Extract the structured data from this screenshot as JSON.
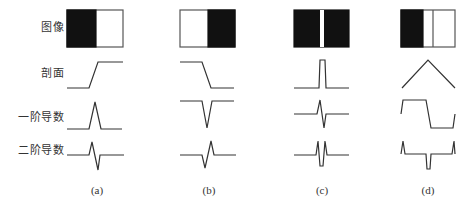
{
  "figure": {
    "row_labels": [
      {
        "key": "image",
        "text": "图像"
      },
      {
        "key": "profile",
        "text": "剖面"
      },
      {
        "key": "first_derivative",
        "text": "一阶导数"
      },
      {
        "key": "second_derivative",
        "text": "二阶导数"
      }
    ],
    "captions": [
      "(a)",
      "(b)",
      "(c)",
      "(d)"
    ],
    "colors": {
      "stroke": "#333333",
      "fill_dark": "#111111",
      "background": "#ffffff"
    },
    "columns": [
      {
        "caption": "(a)",
        "description": "step edge dark-to-light",
        "image": "left half black, right half white",
        "profile": "low then ramp up then high",
        "first_derivative": "single positive peak",
        "second_derivative": "positive then negative spike"
      },
      {
        "caption": "(b)",
        "description": "step edge light-to-dark",
        "image": "left half white, right half black",
        "profile": "high then ramp down then low",
        "first_derivative": "single negative peak",
        "second_derivative": "negative then positive spike"
      },
      {
        "caption": "(c)",
        "description": "thin bright line",
        "image": "black with thin white vertical stripe",
        "profile": "narrow rectangular pulse",
        "first_derivative": "positive then negative spike",
        "second_derivative": "double positive spikes with central negative dip"
      },
      {
        "caption": "(d)",
        "description": "roof edge",
        "image": "black left, white right with a vertical line",
        "profile": "triangular roof",
        "first_derivative": "high plateau then low plateau",
        "second_derivative": "spikes at ends with central negative dip"
      }
    ]
  }
}
